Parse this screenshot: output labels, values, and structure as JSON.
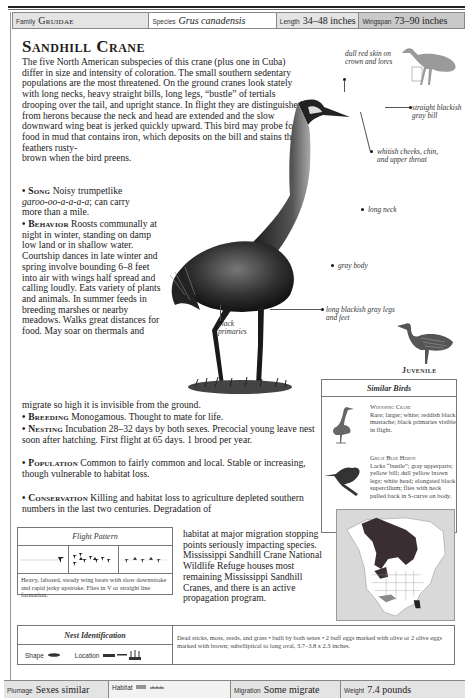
{
  "header": {
    "family": {
      "label": "Family",
      "value": "Gruidae"
    },
    "species": {
      "label": "Species",
      "value": "Grus canadensis"
    },
    "length": {
      "label": "Length",
      "value": "34–48 inches"
    },
    "wingspan": {
      "label": "Wingspan",
      "value": "73–90 inches"
    }
  },
  "title": "Sandhill Crane",
  "intro": "The five North American subspecies of this crane (plus one in Cuba) differ in size and intensity of coloration. The small southern sedentary populations are the most threatened. On the ground cranes look stately with long necks, heavy straight bills, long legs, “bustle” of tertials drooping over the tail, and upright stance. In flight they are distinguished from herons because the neck and head are extended and the slow downward wing beat is jerked quickly upward. This bird may probe for food in mud that contains iron, which deposits on the bill and stains the feathers rusty-",
  "intro_end": "brown when the bird preens.",
  "sections": {
    "song": {
      "head": "• Song",
      "text_pre": " Noisy trumpetlike ",
      "text_ital": "garoo-oo-a-a-a-a",
      "text_post": "; can carry more than a mile."
    },
    "behavior": {
      "head": "• Behavior",
      "text": " Roosts communally at night in winter, standing on damp low land or in shallow water. Courtship dances in late winter and spring involve bounding 6–8 feet into air with wings half spread and calling loudly. Eats variety of plants and animals. In summer feeds in breeding marshes or nearby meadows. Walks great distances for food. May soar on thermals and",
      "text_end": "migrate so high it is invisible from the ground."
    },
    "breeding": {
      "head": "• Breeding",
      "text": " Monogamous. Thought to mate for life."
    },
    "nesting": {
      "head": "• Nesting",
      "text": " Incubation 28–32 days by both sexes. Precocial young leave nest soon after hatching. First flight at 65 days. 1 brood per year."
    },
    "population": {
      "head": "• Population",
      "text": " Common to fairly common and local. Stable or increasing, though vulnerable to habitat loss."
    },
    "conservation": {
      "head": "• Conservation",
      "text": "  Killing and habitat loss to agriculture depleted southern numbers in the last two centuries. Degradation of",
      "text_cont": "habitat at major migration stopping points seriously impacting species. Mississippi Sandhill Crane National Wildlife Refuge houses most remaining Mississippi Sandhill Cranes, and there is an active propagation program."
    }
  },
  "callouts": {
    "crown": "dull red skin on crown and lores",
    "bill": "straight blackish gray bill",
    "cheeks": "whitish cheeks, chin, and upper throat",
    "neck": "long neck",
    "body": "gray body",
    "primaries": "black primaries",
    "legs": "long blackish gray legs and feet"
  },
  "juvenile_label": "Juvenile",
  "similar_birds": {
    "title": "Similar Birds",
    "items": [
      {
        "name": "Whooping Crane",
        "desc": "Rare; larger; white; reddish black mustache; black primaries visible in flight."
      },
      {
        "name": "Great Blue Heron",
        "desc": "Lacks “bustle”; gray upperparts; yellow bill; dull yellow brown legs; white head; elongated black supercilium; flies with neck pulled back in S-curve on body."
      }
    ]
  },
  "flight_pattern": {
    "title": "Flight Pattern",
    "desc": "Heavy, labored, steady wing beats with slow downstroke and rapid jerky upstroke. Flies in V or straight line formation."
  },
  "nest_identification": {
    "title": "Nest Identification",
    "shape_label": "Shape",
    "location_label": "Location",
    "desc": "Dead sticks, moss, reeds, and grass • built by both sexes • 2 buff eggs marked with olive or 2 olive eggs marked with brown; subelliptical to long oval, 3.7–3.8 x 2.3 inches."
  },
  "footer": {
    "plumage": {
      "label": "Plumage",
      "value": "Sexes similar"
    },
    "habitat": {
      "label": "Habitat",
      "value": ""
    },
    "migration": {
      "label": "Migration",
      "value": "Some migrate"
    },
    "weight": {
      "label": "Weight",
      "value": "7.4 pounds"
    }
  }
}
